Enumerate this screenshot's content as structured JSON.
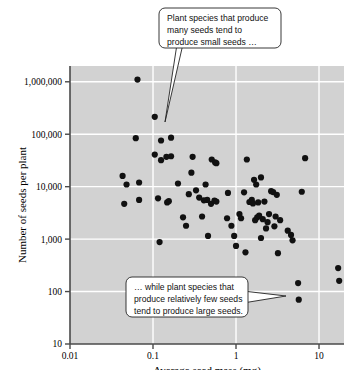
{
  "figure": {
    "title": "",
    "background_color": "#ffffff",
    "plot_background_color": "#d2d2d2",
    "gridline_color": "#ffffff",
    "point_color": "#111111",
    "axis_color": "#555555"
  },
  "axes": {
    "x": {
      "label": "Average seed mass (mg)",
      "ticks": [
        "0.01",
        "0.1",
        "1",
        "10"
      ],
      "scale": "log",
      "min": 0.01,
      "max": 20
    },
    "y": {
      "label": "Number of seeds per plant",
      "ticks": [
        "10",
        "100",
        "1,000",
        "10,000",
        "100,000",
        "1,000,000"
      ],
      "scale": "log",
      "min": 10,
      "max": 2000000
    }
  },
  "callouts": [
    {
      "name": "callout-top",
      "lines": [
        "Plant species that produce",
        "many seeds tend to",
        "produce small seeds …"
      ]
    },
    {
      "name": "callout-bottom",
      "lines": [
        "… while plant species that",
        "produce relatively few seeds",
        "tend to produce large seeds."
      ]
    }
  ],
  "chart_data": {
    "type": "scatter",
    "title": "",
    "xlabel": "Average seed mass (mg)",
    "ylabel": "Number of seeds per plant",
    "xscale": "log",
    "yscale": "log",
    "xlim": [
      0.01,
      20
    ],
    "ylim": [
      10,
      2000000
    ],
    "xticks": [
      0.01,
      0.1,
      1,
      10
    ],
    "xticklabels": [
      "0.01",
      "0.1",
      "1",
      "10"
    ],
    "yticks": [
      10,
      100,
      1000,
      10000,
      100000,
      1000000
    ],
    "yticklabels": [
      "10",
      "100",
      "1,000",
      "10,000",
      "100,000",
      "1,000,000"
    ],
    "grid": true,
    "legend": "none",
    "annotations": [
      "Plant species that produce many seeds tend to produce small seeds …",
      "… while plant species that produce relatively few seeds tend to produce large seeds."
    ],
    "points": [
      [
        0.065,
        1100000
      ],
      [
        0.105,
        215000
      ],
      [
        0.062,
        84000
      ],
      [
        0.125,
        76000
      ],
      [
        0.165,
        86000
      ],
      [
        0.105,
        41000
      ],
      [
        0.125,
        32000
      ],
      [
        0.145,
        37000
      ],
      [
        0.165,
        38000
      ],
      [
        0.3,
        37000
      ],
      [
        0.51,
        33000
      ],
      [
        0.56,
        29000
      ],
      [
        0.58,
        28000
      ],
      [
        1.35,
        33000
      ],
      [
        6.8,
        35000
      ],
      [
        0.043,
        16000
      ],
      [
        0.048,
        11000
      ],
      [
        0.068,
        12000
      ],
      [
        0.068,
        5600
      ],
      [
        0.045,
        4700
      ],
      [
        0.115,
        6000
      ],
      [
        0.148,
        5000
      ],
      [
        0.155,
        5300
      ],
      [
        0.2,
        11500
      ],
      [
        0.27,
        7200
      ],
      [
        0.29,
        18500
      ],
      [
        0.33,
        8500
      ],
      [
        0.36,
        6200
      ],
      [
        0.43,
        11000
      ],
      [
        0.45,
        5600
      ],
      [
        0.5,
        4700
      ],
      [
        0.8,
        7600
      ],
      [
        1.25,
        7800
      ],
      [
        1.65,
        13500
      ],
      [
        1.75,
        11000
      ],
      [
        2.0,
        15000
      ],
      [
        2.65,
        8200
      ],
      [
        2.8,
        7900
      ],
      [
        3.1,
        7000
      ],
      [
        6.2,
        8000
      ],
      [
        0.12,
        880
      ],
      [
        0.23,
        2600
      ],
      [
        0.25,
        1800
      ],
      [
        0.39,
        2700
      ],
      [
        0.41,
        5500
      ],
      [
        0.46,
        1150
      ],
      [
        0.55,
        5400
      ],
      [
        0.58,
        5200
      ],
      [
        0.78,
        2500
      ],
      [
        0.88,
        1800
      ],
      [
        0.95,
        1150
      ],
      [
        1.0,
        740
      ],
      [
        1.1,
        3000
      ],
      [
        1.15,
        2500
      ],
      [
        1.3,
        560
      ],
      [
        1.45,
        5100
      ],
      [
        1.55,
        5600
      ],
      [
        1.6,
        4800
      ],
      [
        1.7,
        2300
      ],
      [
        1.8,
        2600
      ],
      [
        1.85,
        5000
      ],
      [
        1.9,
        2800
      ],
      [
        2.0,
        1050
      ],
      [
        2.1,
        2400
      ],
      [
        2.2,
        5200
      ],
      [
        2.3,
        1600
      ],
      [
        2.4,
        2100
      ],
      [
        2.5,
        3000
      ],
      [
        2.9,
        1750
      ],
      [
        3.0,
        2700
      ],
      [
        3.2,
        540
      ],
      [
        3.4,
        2300
      ],
      [
        4.2,
        1450
      ],
      [
        4.6,
        1200
      ],
      [
        4.8,
        950
      ],
      [
        5.6,
        145
      ],
      [
        5.7,
        70
      ],
      [
        17.0,
        280
      ],
      [
        17.5,
        160
      ]
    ]
  }
}
